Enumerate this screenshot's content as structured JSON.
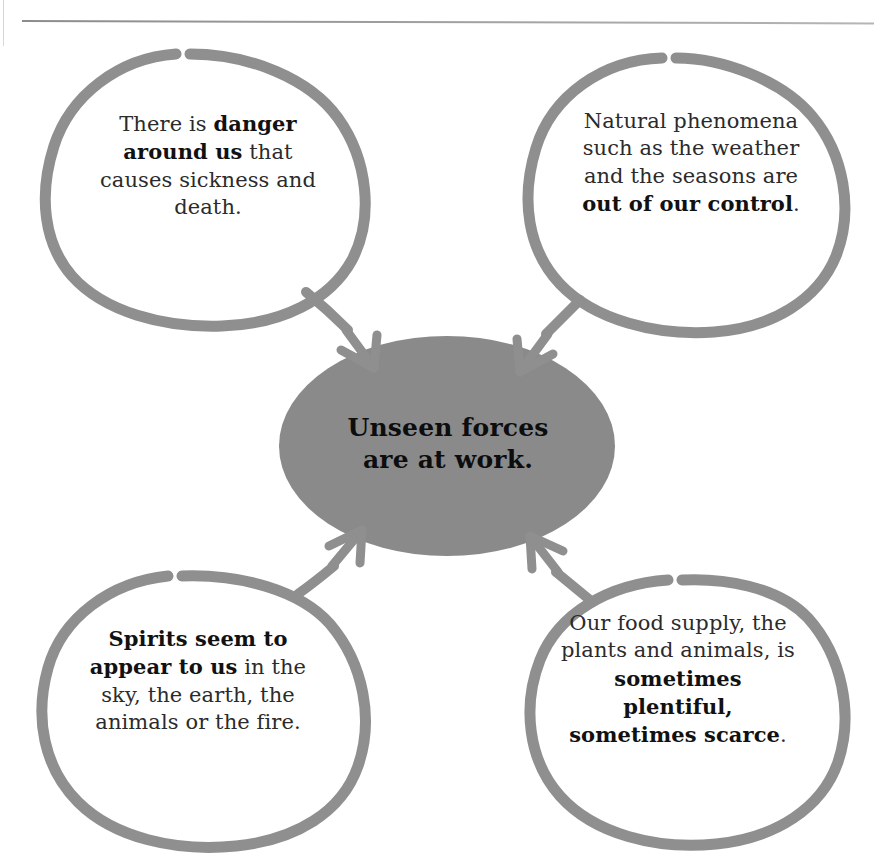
{
  "page": {
    "background_color": "#ffffff",
    "header_rule_color": "#8c8c8c",
    "ghost_header_text": ""
  },
  "palette": {
    "bubble_stroke": "#8f8f8f",
    "ellipse_fill": "#8a8a8a",
    "arrow_color": "#8f8f8f",
    "body_text": "#2b2b2b",
    "bold_text": "#111111"
  },
  "diagram": {
    "type": "cause-effect-cluster",
    "center": {
      "shape": "ellipse",
      "fill": "#8a8a8a",
      "line_1": "Unseen forces",
      "line_2": "are at work."
    },
    "bubbles": [
      {
        "id": "top-left",
        "position": "top-left",
        "arrow_direction": "down-right",
        "runs": [
          {
            "text": "There is ",
            "bold": false
          },
          {
            "text": "danger around us",
            "bold": true
          },
          {
            "text": " that causes sickness and death.",
            "bold": false
          }
        ],
        "plain_text": "There is danger around us that causes sickness and death."
      },
      {
        "id": "top-right",
        "position": "top-right",
        "arrow_direction": "down-left",
        "runs": [
          {
            "text": "Natural phenomena such as the weather and the seasons are ",
            "bold": false
          },
          {
            "text": "out of our control",
            "bold": true
          },
          {
            "text": ".",
            "bold": false
          }
        ],
        "plain_text": "Natural phenomena such as the weather and the seasons are out of our control."
      },
      {
        "id": "bottom-left",
        "position": "bottom-left",
        "arrow_direction": "up-right",
        "runs": [
          {
            "text": "Spirits seem to appear to us",
            "bold": true
          },
          {
            "text": " in the sky, the earth, the animals or the fire.",
            "bold": false
          }
        ],
        "plain_text": "Spirits seem to appear to us in the sky, the earth, the animals or the fire."
      },
      {
        "id": "bottom-right",
        "position": "bottom-right",
        "arrow_direction": "up-left",
        "runs": [
          {
            "text": "Our food supply, the plants and animals, is ",
            "bold": false
          },
          {
            "text": "sometimes plentiful, sometimes scarce",
            "bold": true
          },
          {
            "text": ".",
            "bold": false
          }
        ],
        "plain_text": "Our food supply, the plants and animals, is sometimes plentiful, sometimes scarce."
      }
    ]
  }
}
